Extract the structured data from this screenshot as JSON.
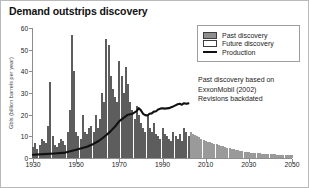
{
  "chart_data": {
    "type": "bar",
    "title": "Demand outstrips discovery",
    "xlabel": "",
    "ylabel": "Gbls (billion barrels per year)",
    "xlim": [
      1930,
      2050
    ],
    "ylim": [
      0,
      60
    ],
    "ytick_labels": [
      "0",
      "10",
      "20",
      "30",
      "40",
      "50",
      "60"
    ],
    "ytick_values": [
      0,
      10,
      20,
      30,
      40,
      50,
      60
    ],
    "xtick_labels": [
      "1930",
      "1950",
      "1970",
      "1990",
      "2010",
      "2030",
      "2050"
    ],
    "xtick_values": [
      1930,
      1950,
      1970,
      1990,
      2010,
      2030,
      2050
    ],
    "grid": false,
    "legend_position": "top-right",
    "split_year": 2003,
    "series": [
      {
        "name": "Past discovery",
        "type": "bar",
        "color": "#8e8e8e",
        "x": [
          1930,
          1931,
          1932,
          1933,
          1934,
          1935,
          1936,
          1937,
          1938,
          1939,
          1940,
          1941,
          1942,
          1943,
          1944,
          1945,
          1946,
          1947,
          1948,
          1949,
          1950,
          1951,
          1952,
          1953,
          1954,
          1955,
          1956,
          1957,
          1958,
          1959,
          1960,
          1961,
          1962,
          1963,
          1964,
          1965,
          1966,
          1967,
          1968,
          1969,
          1970,
          1971,
          1972,
          1973,
          1974,
          1975,
          1976,
          1977,
          1978,
          1979,
          1980,
          1981,
          1982,
          1983,
          1984,
          1985,
          1986,
          1987,
          1988,
          1989,
          1990,
          1991,
          1992,
          1993,
          1994,
          1995,
          1996,
          1997,
          1998,
          1999,
          2000,
          2001,
          2002
        ],
        "values": [
          5,
          7,
          4,
          6,
          9,
          8,
          7,
          15,
          35,
          10,
          6,
          5,
          7,
          9,
          8,
          6,
          12,
          22,
          57,
          40,
          12,
          10,
          9,
          20,
          12,
          11,
          14,
          15,
          12,
          20,
          14,
          18,
          30,
          26,
          55,
          52,
          38,
          32,
          28,
          26,
          45,
          38,
          30,
          42,
          34,
          26,
          22,
          18,
          24,
          20,
          16,
          14,
          12,
          20,
          14,
          12,
          16,
          11,
          10,
          9,
          14,
          11,
          10,
          9,
          8,
          12,
          10,
          9,
          11,
          8,
          14,
          12,
          10
        ]
      },
      {
        "name": "Future discovery",
        "type": "bar",
        "color": "#e4e4e4",
        "x": [
          2003,
          2004,
          2005,
          2006,
          2007,
          2008,
          2009,
          2010,
          2011,
          2012,
          2013,
          2014,
          2015,
          2016,
          2017,
          2018,
          2019,
          2020,
          2021,
          2022,
          2023,
          2024,
          2025,
          2026,
          2027,
          2028,
          2029,
          2030,
          2031,
          2032,
          2033,
          2034,
          2035,
          2036,
          2037,
          2038,
          2039,
          2040,
          2041,
          2042,
          2043,
          2044,
          2045,
          2046,
          2047,
          2048,
          2049,
          2050
        ],
        "values": [
          12,
          11,
          10.5,
          10,
          9.5,
          9,
          8.5,
          8,
          7.5,
          7.2,
          6.9,
          6.6,
          6.3,
          6,
          5.7,
          5.4,
          5.1,
          4.8,
          4.5,
          4.2,
          4,
          3.8,
          3.6,
          3.4,
          3.2,
          3,
          2.8,
          2.6,
          2.5,
          2.4,
          2.3,
          2.2,
          2.1,
          2,
          1.9,
          1.85,
          1.8,
          1.75,
          1.7,
          1.65,
          1.6,
          1.55,
          1.5,
          1.45,
          1.4,
          1.35,
          1.3,
          1.25
        ]
      },
      {
        "name": "Production",
        "type": "line",
        "color": "#111111",
        "x": [
          1930,
          1935,
          1940,
          1945,
          1950,
          1955,
          1958,
          1960,
          1962,
          1964,
          1966,
          1968,
          1970,
          1972,
          1974,
          1976,
          1978,
          1979,
          1980,
          1981,
          1982,
          1983,
          1984,
          1985,
          1986,
          1987,
          1988,
          1989,
          1990,
          1991,
          1992,
          1993,
          1994,
          1995,
          1996,
          1997,
          1998,
          1999,
          2000,
          2001,
          2002
        ],
        "values": [
          1.5,
          1.8,
          2.1,
          2.5,
          3.8,
          5.2,
          6.5,
          7.6,
          9.0,
          10.6,
          12.4,
          14.5,
          17.0,
          18.5,
          20.0,
          20.4,
          21.6,
          23.0,
          22.0,
          20.4,
          19.8,
          19.6,
          20.4,
          20.6,
          21.4,
          21.6,
          22.4,
          22.8,
          23.0,
          22.8,
          22.9,
          23.0,
          23.4,
          23.8,
          24.3,
          24.8,
          25.0,
          24.6,
          25.3,
          25.0,
          25.2
        ]
      }
    ]
  },
  "legend": {
    "items": [
      {
        "label": "Past discovery",
        "swatch": "past"
      },
      {
        "label": "Future discovery",
        "swatch": "future"
      },
      {
        "label": "Production",
        "swatch": "line"
      }
    ]
  },
  "note": {
    "line1": "Past discovery based on",
    "line2": "ExxonMobil (2002)",
    "line3": "Revisions backdated"
  }
}
